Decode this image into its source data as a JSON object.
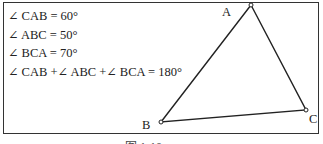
{
  "equations": [
    "∠ CAB = 60°",
    "∠ ABC = 50°",
    "∠ BCA = 70°",
    "∠ CAB +∠ ABC +∠ BCA = 180°"
  ],
  "vertices": {
    "A": "A",
    "B": "B",
    "C": "C"
  },
  "caption": "图 1-10"
}
